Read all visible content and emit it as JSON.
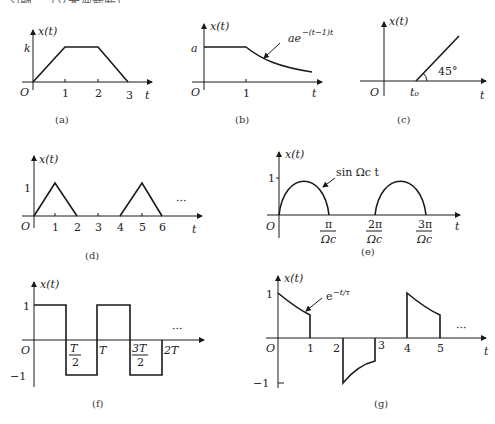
{
  "header": {
    "cropped_text": "习题…（文本被截断）"
  },
  "arrow_color": "#1a1a1a",
  "figures": {
    "a": {
      "caption": "(a)",
      "ylabel": "x(t)",
      "xlabel": "t",
      "origin": "O",
      "ytick": "k",
      "xticks": [
        "1",
        "2",
        "3"
      ]
    },
    "b": {
      "caption": "(b)",
      "ylabel": "x(t)",
      "xlabel": "t",
      "origin": "O",
      "ytick": "a",
      "xticks": [
        "1"
      ],
      "annotation": "ae",
      "annotation_exp": "−(t−1)t"
    },
    "c": {
      "caption": "(c)",
      "ylabel": "x(t)",
      "xlabel": "t",
      "origin": "O",
      "xticks": [
        "t₀"
      ],
      "angle": "45°"
    },
    "d": {
      "caption": "(d)",
      "ylabel": "x(t)",
      "xlabel": "t",
      "origin": "O",
      "ytick": "1",
      "xticks": [
        "1",
        "2",
        "3",
        "4",
        "5",
        "6"
      ],
      "ellipsis": "···"
    },
    "e": {
      "caption": "(e)",
      "ylabel": "x(t)",
      "xlabel": "t",
      "origin": "O",
      "ytick": "1",
      "annotation": "sin Ωc t",
      "xticks": [
        {
          "num": "π",
          "den": "Ωc"
        },
        {
          "num": "2π",
          "den": "Ωc"
        },
        {
          "num": "3π",
          "den": "Ωc"
        }
      ]
    },
    "f": {
      "caption": "(f)",
      "ylabel": "x(t)",
      "xlabel": "",
      "origin": "O",
      "yticks": [
        "1",
        "−1"
      ],
      "xticks": [
        {
          "num": "T",
          "den": "2"
        },
        {
          "label": "T"
        },
        {
          "num": "3T",
          "den": "2"
        },
        {
          "label": "2T"
        }
      ],
      "ellipsis": "···"
    },
    "g": {
      "caption": "(g)",
      "ylabel": "x(t)",
      "xlabel": "t",
      "origin": "O",
      "yticks": [
        "1",
        "−1"
      ],
      "xticks": [
        "1",
        "2",
        "3",
        "4",
        "5"
      ],
      "annotation": "e",
      "annotation_exp": "−t/τ",
      "ellipsis": "···"
    }
  }
}
